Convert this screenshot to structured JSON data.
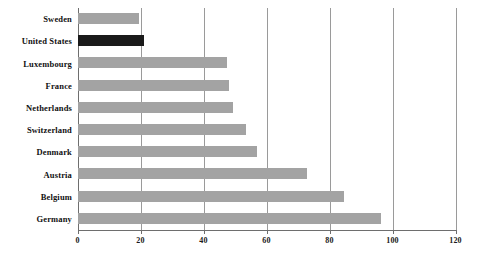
{
  "chart_data": {
    "type": "bar",
    "orientation": "horizontal",
    "title": "",
    "subtitle": "",
    "xlabel": "",
    "ylabel": "",
    "categories": [
      "Sweden",
      "United States",
      "Luxembourg",
      "France",
      "Netherlands",
      "Switzerland",
      "Denmark",
      "Austria",
      "Belgium",
      "Germany"
    ],
    "values": [
      19.5,
      21,
      47.5,
      48,
      49.5,
      53.5,
      57,
      73,
      84.5,
      96.5
    ],
    "xlim": [
      0,
      120
    ],
    "xticks": [
      0,
      20,
      40,
      60,
      80,
      100,
      120
    ],
    "xtick_labels": [
      "0",
      "20",
      "40",
      "60",
      "80",
      "100",
      "120"
    ],
    "grid": true,
    "grid_axis": "x",
    "legend": false,
    "highlighted_category": "United States",
    "bar_color": "#a3a3a3",
    "highlight_color": "#1a1a1a",
    "gridline_color": "#9a9a9a",
    "axis_color": "#6e6e6e",
    "background_color": "#ffffff"
  }
}
